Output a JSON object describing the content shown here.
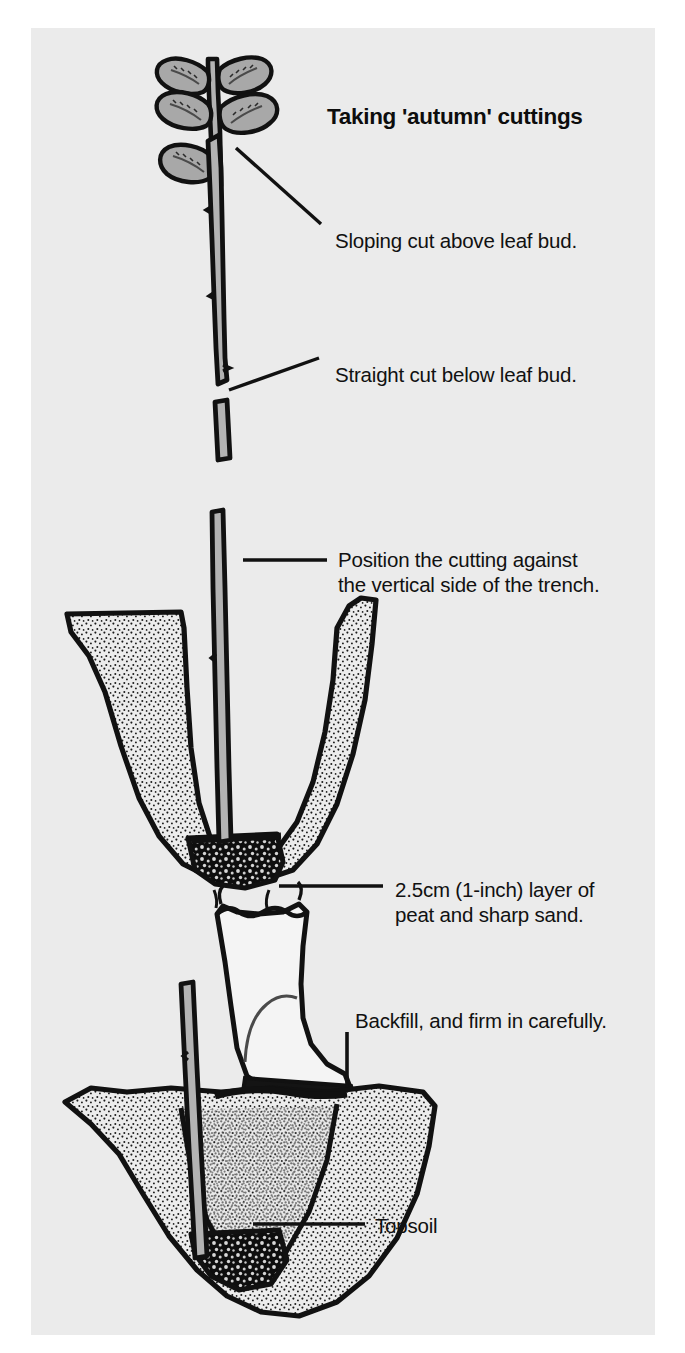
{
  "figure": {
    "title": "Taking 'autumn' cuttings",
    "background_color": "#ebebeb",
    "page_color": "#ffffff",
    "ink_color": "#111111",
    "stem_fill_color": "#b3b3b3",
    "soil_fill_color": "#e2e2e2",
    "peat_color": "#111111"
  },
  "captions": {
    "sloping_cut": "Sloping cut above leaf bud.",
    "straight_cut": "Straight cut below leaf bud.",
    "position_cutting": "Position the cutting against\nthe vertical side of the trench.",
    "peat_layer": "2.5cm (1-inch) layer of\npeat and sharp sand.",
    "backfill": "Backfill, and firm in carefully.",
    "topsoil": "Topsoil"
  },
  "parts": {
    "shoot": "leafy-shoot",
    "cutting_stem": "prepared-cutting-stem",
    "offcut": "discarded-stem-offcut",
    "trench_open": "open-v-trench",
    "trench_filled": "backfilled-trench",
    "sand_layer": "peat-and-sand-layer",
    "boot": "wellington-boot",
    "leaves_top_pairs": 2,
    "leaves_lower": 1
  }
}
